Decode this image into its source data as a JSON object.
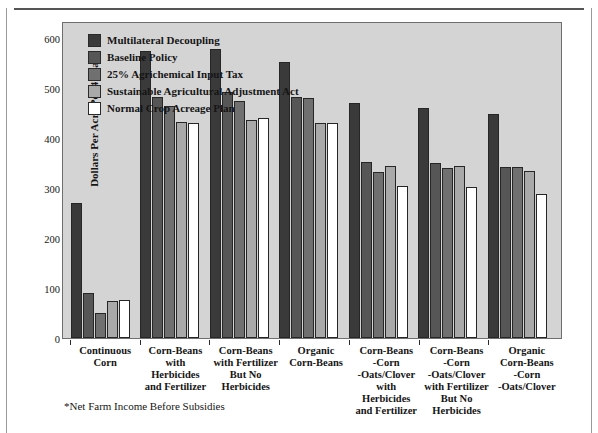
{
  "footnote": "*Net Farm Income Before Subsidies",
  "axis": {
    "y_title": "Dollars Per Acre Per 4 Years",
    "yticks": [
      "600",
      "500",
      "400",
      "300",
      "200",
      "100",
      "0"
    ]
  },
  "legend": {
    "items": [
      {
        "label": "Multilateral Decoupling",
        "color": "#3a3a3a"
      },
      {
        "label": "Baseline Policy",
        "color": "#565656"
      },
      {
        "label": "25%  Agrichemical Input Tax",
        "color": "#707070"
      },
      {
        "label": "Sustainable Agricultural Adjustment Act",
        "color": "#a9a9a9"
      },
      {
        "label": "Normal Crop Acreage Plan",
        "color": "#ffffff"
      }
    ]
  },
  "chart_data": {
    "type": "bar",
    "title": "",
    "xlabel": "",
    "ylabel": "Dollars Per Acre Per 4 Years",
    "ylim": [
      0,
      630
    ],
    "ytick_step": 100,
    "grid": false,
    "legend_position": "top-left",
    "categories": [
      "Continuous\nCorn",
      "Corn-Beans\nwith\nHerbicides\nand Fertilizer",
      "Corn-Beans\nwith Fertilizer\nBut No\nHerbicides",
      "Organic\nCorn-Beans",
      "Corn-Beans\n-Corn\n-Oats/Clover\nwith\nHerbicides\nand Fertilizer",
      "Corn-Beans\n-Corn\n-Oats/Clover\nwith Fertilizer\nBut No\nHerbicides",
      "Organic\nCorn-Beans\n-Corn\n-Oats/Clover"
    ],
    "series": [
      {
        "name": "Multilateral Decoupling",
        "color": "#3a3a3a",
        "values": [
          270,
          575,
          578,
          552,
          470,
          460,
          448
        ]
      },
      {
        "name": "Baseline Policy",
        "color": "#565656",
        "values": [
          90,
          483,
          492,
          483,
          352,
          350,
          343
        ]
      },
      {
        "name": "25%  Agrichemical Input Tax",
        "color": "#707070",
        "values": [
          50,
          465,
          475,
          480,
          332,
          340,
          342
        ]
      },
      {
        "name": "Sustainable Agricultural Adjustment Act",
        "color": "#a9a9a9",
        "values": [
          75,
          432,
          437,
          430,
          345,
          345,
          335
        ]
      },
      {
        "name": "Normal Crop Acreage Plan",
        "color": "#ffffff",
        "values": [
          76,
          430,
          440,
          430,
          305,
          303,
          288
        ]
      }
    ]
  }
}
